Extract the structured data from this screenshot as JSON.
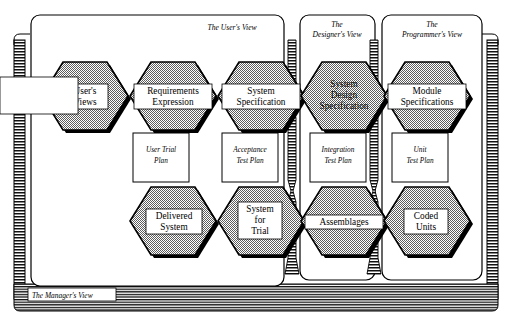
{
  "diagram": {
    "colors": {
      "hex_fill": "#a8a8a8",
      "hex_stroke": "#000000",
      "label_box_fill": "#ffffff",
      "panel_fill": "#ffffff",
      "panel_stroke": "#000000",
      "band_stroke": "#000000",
      "shadow": "#000000",
      "background": "#ffffff"
    },
    "frame": {
      "manager_band_name": "manager-view-band",
      "left_band_name": "left-hatch-band",
      "right_band_name": "right-hatch-band"
    },
    "panels": [
      {
        "id": "users-view",
        "label_lines": [
          "The User's View"
        ]
      },
      {
        "id": "designers-view",
        "label_lines": [
          "The",
          "Designer's View"
        ]
      },
      {
        "id": "programmers-view",
        "label_lines": [
          "The",
          "Programmer's View"
        ]
      }
    ],
    "manager_view": {
      "label": "The Manager's View"
    },
    "top_row": [
      {
        "id": "users-views",
        "lines": [
          "User's",
          "Views"
        ]
      },
      {
        "id": "requirements-expression",
        "lines": [
          "Requirements",
          "Expression"
        ]
      },
      {
        "id": "system-specification",
        "lines": [
          "System",
          "Specification"
        ]
      },
      {
        "id": "system-design-specification",
        "lines": [
          "System",
          "Design",
          "Specification"
        ]
      },
      {
        "id": "module-specifications",
        "lines": [
          "Module",
          "Specifications"
        ]
      }
    ],
    "plans": [
      {
        "id": "user-trial-plan",
        "lines": [
          "User Trial",
          "Plan"
        ]
      },
      {
        "id": "acceptance-test-plan",
        "lines": [
          "Acceptance",
          "Test Plan"
        ]
      },
      {
        "id": "integration-test-plan",
        "lines": [
          "Integration",
          "Test Plan"
        ]
      },
      {
        "id": "unit-test-plan",
        "lines": [
          "Unit",
          "Test Plan"
        ]
      }
    ],
    "bottom_row": [
      {
        "id": "delivered-system",
        "lines": [
          "Delivered",
          "System"
        ]
      },
      {
        "id": "system-for-trial",
        "lines": [
          "System",
          "for",
          "Trial"
        ]
      },
      {
        "id": "assemblages",
        "lines": [
          "Assemblages"
        ]
      },
      {
        "id": "coded-units",
        "lines": [
          "Coded",
          "Units"
        ]
      }
    ]
  }
}
